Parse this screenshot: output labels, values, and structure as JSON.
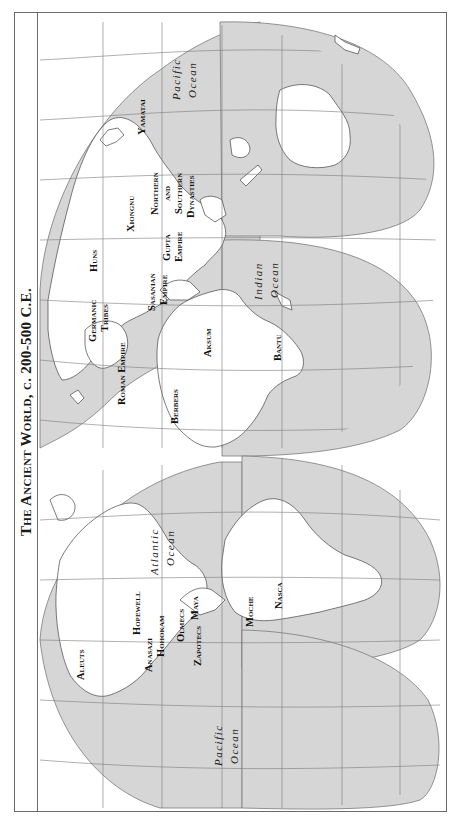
{
  "title": "The Ancient World, c. 200-500 C.E.",
  "colors": {
    "ocean": "#d6d6d6",
    "land": "#ffffff",
    "grid": "#7a7a7a",
    "frame": "#6a6a6a",
    "text": "#111111"
  },
  "orientation": "rotated 90° counter-clockwise (north at left)",
  "oceans": [
    {
      "id": "pacific-east",
      "line1": "Pacific",
      "line2": "Ocean"
    },
    {
      "id": "indian",
      "line1": "Indian",
      "line2": "Ocean"
    },
    {
      "id": "atlantic",
      "line1": "Atlantic",
      "line2": "Ocean"
    },
    {
      "id": "pacific-west",
      "line1": "Pacific",
      "line2": "Ocean"
    }
  ],
  "peoples": {
    "eurasia_africa": [
      {
        "id": "yamatai",
        "lines": [
          "Yamatai"
        ]
      },
      {
        "id": "xiongnu",
        "lines": [
          "Xiongnu"
        ]
      },
      {
        "id": "northern-southern",
        "lines": [
          "Northern",
          "and",
          "Southern",
          "Dynasties"
        ]
      },
      {
        "id": "huns",
        "lines": [
          "Huns"
        ]
      },
      {
        "id": "gupta",
        "lines": [
          "Gupta",
          "Empire"
        ]
      },
      {
        "id": "sasanian",
        "lines": [
          "Sasanian",
          "Empire"
        ]
      },
      {
        "id": "germanic",
        "lines": [
          "Germanic",
          "Tribes"
        ]
      },
      {
        "id": "roman",
        "lines": [
          "Roman Empire"
        ]
      },
      {
        "id": "aksum",
        "lines": [
          "Aksum"
        ]
      },
      {
        "id": "berbers",
        "lines": [
          "Berbers"
        ]
      },
      {
        "id": "bantu",
        "lines": [
          "Bantu"
        ]
      }
    ],
    "americas": [
      {
        "id": "hopewell",
        "lines": [
          "Hopewell"
        ]
      },
      {
        "id": "anasazi",
        "lines": [
          "Anasazi"
        ]
      },
      {
        "id": "hohokam",
        "lines": [
          "Hohokam"
        ]
      },
      {
        "id": "olmecs",
        "lines": [
          "Olmecs"
        ]
      },
      {
        "id": "maya",
        "lines": [
          "Maya"
        ]
      },
      {
        "id": "zapotecs",
        "lines": [
          "Zapotecs"
        ]
      },
      {
        "id": "aleuts",
        "lines": [
          "Aleuts"
        ]
      },
      {
        "id": "moche",
        "lines": [
          "Moche"
        ]
      },
      {
        "id": "nasca",
        "lines": [
          "Nasca"
        ]
      }
    ]
  }
}
